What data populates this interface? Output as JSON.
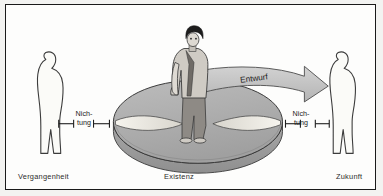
{
  "figure": {
    "type": "diagram",
    "caption_left": "Vergangenheit",
    "caption_center": "Existenz",
    "caption_right": "Zukunft",
    "arrow_label": "Entwurf",
    "nichtung_left_line1": "Nich-",
    "nichtung_left_line2": "tung",
    "nichtung_right_line1": "Nich-",
    "nichtung_right_line2": "tung",
    "colors": {
      "frame_border": "#1a1a1a",
      "background": "#fdfdfc",
      "outer_background": "#f3f3f1",
      "disc_top": "#b0b0b0",
      "disc_rim": "#9a9a9a",
      "disc_outline": "#3a3a3a",
      "wedge_fill": "#f0eee7",
      "arrow_fill": "#c2c2c2",
      "arrow_outline": "#4a4a4a",
      "silhouette_fill": "#fbfbf8",
      "silhouette_outline": "#3c3c3c",
      "person_jacket": "#cfcbc4",
      "person_trousers": "#8e8a85",
      "person_hair": "#1d1d1d",
      "text": "#2b2b2b"
    }
  }
}
